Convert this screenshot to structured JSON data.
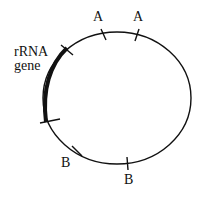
{
  "diagram": {
    "gene_label_line1": "rRNA",
    "gene_label_line2": "gene",
    "sites": [
      {
        "label": "A",
        "position": "top-left"
      },
      {
        "label": "A",
        "position": "top-right"
      },
      {
        "label": "B",
        "position": "bottom-left"
      },
      {
        "label": "B",
        "position": "bottom"
      }
    ],
    "colors": {
      "line": "#111111",
      "background": "#ffffff"
    }
  }
}
